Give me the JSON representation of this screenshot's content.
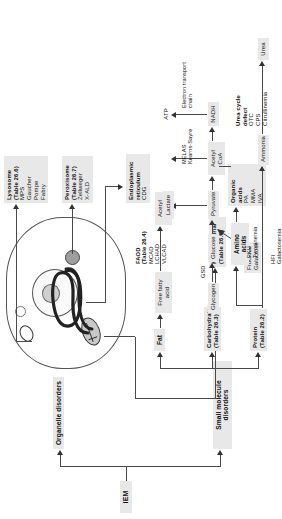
{
  "diagram": {
    "root": "IEM",
    "branches": {
      "organelle": "Organelle disorders",
      "small": "Small molecule disorders"
    },
    "organelles": [
      {
        "title": "Lysosome",
        "table": "(Table 26.6)",
        "items": "MPS\nGaucher\nPompe\nFabry"
      },
      {
        "title": "Peroxisome",
        "table": "(Table 26.7)",
        "items": "Zellweger\nX-ALD"
      },
      {
        "title": "Endoplasmic\nreticulum",
        "table": "",
        "items": "CDG"
      },
      {
        "title": "Mitochondrial",
        "table": "(Table 26.5)",
        "items": ""
      }
    ],
    "substrates": [
      {
        "title": "Fat",
        "table": "",
        "items": ""
      },
      {
        "title": "Carbohydrates",
        "table": "(Table 26.3)",
        "items": ""
      },
      {
        "title": "Protein",
        "table": "(Table 26.2)",
        "items": ""
      }
    ],
    "pathway": {
      "free_fatty_acid": "Free fatty acid",
      "faod_title": "FAOD",
      "faod_table": "(Table 26.4)",
      "faod_items": "MCAD\nLCHAD\nVLCAD",
      "glycogen": "Glycogen",
      "gsd": "GSD",
      "glucose": "Glucose",
      "pyruvate": "Pyruvate",
      "lactate": "Lactate",
      "acetyl_coa_top": "Acetyl CoA",
      "acetyl_coa_bottom": "Acetyl CoA",
      "nadh": "NADH",
      "atp": "ATP",
      "etc": "Electron transport\nchain",
      "mito_diseases": "MELAS\nKearns-Sayre",
      "fructose_galactose": "Fructose\nGalactose",
      "hfi_galactosemia": "HFI\nGalactosemia",
      "amino_acids": "Amino acids",
      "pku_tyrosinemia": "PKU\nTyrosinemia",
      "organic_acids_title": "Organic acids",
      "organic_acids_items": "PA\nMMA\nIVA",
      "ammonia": "Ammonia",
      "urea_cycle_title": "Urea cycle defect",
      "urea_cycle_items": "OTC\nCPS\nCitrullinemia",
      "urea": "Urea"
    },
    "colors": {
      "box": "#e8e8e8",
      "line": "#4a4a4a",
      "arrow": "#333333"
    }
  }
}
